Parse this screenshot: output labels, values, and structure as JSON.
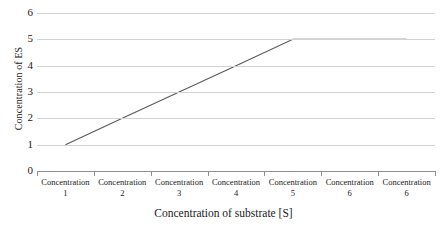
{
  "chart_data": {
    "type": "line",
    "title": "",
    "xlabel": "Concentration of substrate [S]",
    "ylabel": "Concentration of ES",
    "categories": [
      "Concentration 1",
      "Concentration 2",
      "Concentration 3",
      "Concentration 4",
      "Concentration 5",
      "Concentration 6",
      "Concentration 6"
    ],
    "category_names": [
      "Concentration",
      "Concentration",
      "Concentration",
      "Concentration",
      "Concentration",
      "Concentration",
      "Concentration"
    ],
    "category_numbers": [
      "1",
      "2",
      "3",
      "4",
      "5",
      "6",
      "6"
    ],
    "values": [
      1,
      2,
      3,
      4,
      5,
      5,
      5
    ],
    "ylim": [
      0,
      6
    ],
    "y_ticks": [
      "6",
      "5",
      "4",
      "3",
      "2",
      "1",
      "0"
    ],
    "y_tick_values": [
      6,
      5,
      4,
      3,
      2,
      1,
      0
    ],
    "grid": true,
    "legend": "none",
    "series_color": "#5a5a5a",
    "gridline_color": "#d2d2d2",
    "axis_color": "#8f8f8f"
  },
  "axis": {
    "y_title": "Concentration of ES",
    "x_title": "Concentration of substrate [S]"
  }
}
